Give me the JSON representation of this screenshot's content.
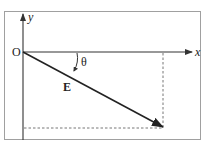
{
  "diagram": {
    "labels": {
      "origin": "O",
      "x_axis": "x",
      "y_axis": "y",
      "vector": "E",
      "angle": "θ"
    },
    "colors": {
      "frame": "#9a9a9a",
      "axis": "#333333",
      "vector": "#222222",
      "dashed": "#777777",
      "background": "#ffffff"
    }
  }
}
